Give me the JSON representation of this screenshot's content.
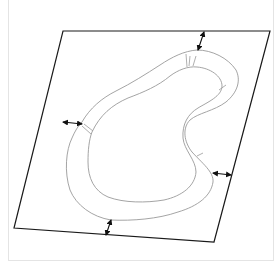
{
  "diagram": {
    "colors": {
      "sheet_edge": "#1a1a1a",
      "ring_outline": "#9a9a9a",
      "arrow": "#111111",
      "frame_border": "#e4e4e4"
    },
    "sheet": {
      "corners": [
        [
          63,
          31
        ],
        [
          270,
          31
        ],
        [
          214,
          242
        ],
        [
          14,
          228
        ]
      ]
    },
    "ring": {
      "outer_outline": "outer",
      "inner_outline": "inner"
    },
    "dimension_arrows": [
      {
        "name": "top-clearance",
        "from": [
          204,
          31
        ],
        "to": [
          197,
          50
        ]
      },
      {
        "name": "left-clearance",
        "from": [
          63,
          122
        ],
        "to": [
          82,
          124
        ]
      },
      {
        "name": "right-clearance",
        "from": [
          213,
          173
        ],
        "to": [
          231,
          175
        ]
      },
      {
        "name": "bottom-clearance",
        "from": [
          111,
          220
        ],
        "to": [
          106,
          235
        ]
      }
    ],
    "labels": []
  }
}
